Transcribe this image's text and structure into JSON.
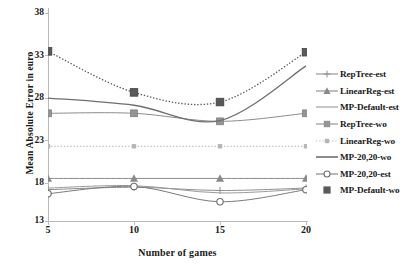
{
  "chart_data": {
    "type": "line",
    "title": "",
    "xlabel": "Number of games",
    "ylabel": "Mean Absolute Error in euro",
    "categories": [
      5,
      10,
      15,
      20
    ],
    "x": [
      5,
      10,
      15,
      20
    ],
    "xtick_labels": [
      "5",
      "10",
      "15",
      "20"
    ],
    "ytick_labels": [
      "13",
      "18",
      "23",
      "28",
      "33",
      "38"
    ],
    "yticks": [
      13,
      18,
      23,
      28,
      33,
      38
    ],
    "ylim": [
      13,
      38
    ],
    "xlim": [
      5,
      20
    ],
    "grid": false,
    "legend_position": "right",
    "series": [
      {
        "name": "RepTree-est",
        "values": [
          15.9,
          16.2,
          15.8,
          16.1
        ],
        "color": "#8f8f8f",
        "marker": "plus",
        "line": "solid"
      },
      {
        "name": "LinearReg-est",
        "values": [
          17.3,
          17.3,
          17.3,
          17.3
        ],
        "color": "#8a8a8a",
        "marker": "triangle",
        "line": "solid"
      },
      {
        "name": "MP-Default-est",
        "values": [
          16.1,
          16.4,
          15.5,
          16.0
        ],
        "color": "#9a9a9a",
        "marker": "none",
        "line": "solid"
      },
      {
        "name": "RepTree-wo",
        "values": [
          25.4,
          25.4,
          24.4,
          25.4
        ],
        "color": "#8c8c8c",
        "marker": "square",
        "line": "solid"
      },
      {
        "name": "LinearReg-wo",
        "values": [
          21.3,
          21.3,
          21.3,
          21.3
        ],
        "color": "#b0b0b0",
        "marker": "small-square",
        "line": "dotted"
      },
      {
        "name": "MP-20,20-wo",
        "values": [
          27.3,
          26.4,
          24.5,
          31.3
        ],
        "color": "#6f6f6f",
        "marker": "none",
        "line": "solid"
      },
      {
        "name": "MP-20,20-est",
        "values": [
          15.4,
          16.3,
          14.4,
          15.9
        ],
        "color": "#7a7a7a",
        "marker": "circle",
        "line": "solid"
      },
      {
        "name": "MP-Default-wo",
        "values": [
          33.1,
          28.0,
          26.8,
          33.0
        ],
        "color": "#5a5a5a",
        "marker": "square-dark",
        "line": "dotted"
      }
    ]
  },
  "legend": {
    "items": [
      {
        "label": "RepTree-est"
      },
      {
        "label": "LinearReg-est"
      },
      {
        "label": "MP-Default-est"
      },
      {
        "label": "RepTree-wo"
      },
      {
        "label": "LinearReg-wo"
      },
      {
        "label": "MP-20,20-wo"
      },
      {
        "label": "MP-20,20-est"
      },
      {
        "label": "MP-Default-wo"
      }
    ]
  }
}
